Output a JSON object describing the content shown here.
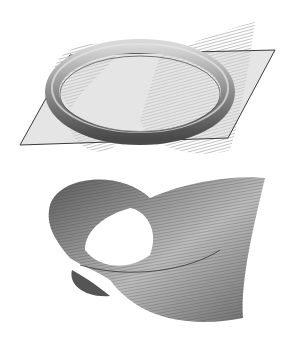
{
  "figures": [
    {
      "id": "top",
      "description": "Torus ring intersecting a translucent plane, with a hatched ruled surface (Mobius-like band) passing through it",
      "colors": {
        "plane_fill": "#c9c9c9",
        "plane_edge": "#3a3a3a",
        "torus": "#8a8a8a",
        "hatch": "#555555"
      }
    },
    {
      "id": "bottom",
      "description": "Shaded ruled surface (twisted Mobius-like band) with dense ruling lines",
      "colors": {
        "surface": "#7a7a7a",
        "surface_light": "#bdbdbd",
        "ruling": "#444444"
      }
    }
  ]
}
